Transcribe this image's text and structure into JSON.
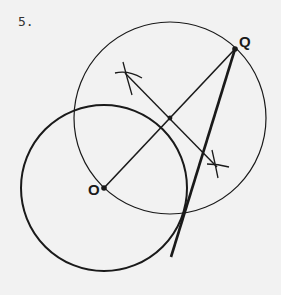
{
  "problem": {
    "number": "5."
  },
  "points": {
    "O": {
      "label": "O",
      "x": 104,
      "y": 188
    },
    "Q": {
      "label": "Q",
      "x": 235,
      "y": 49
    },
    "M": {
      "x": 170,
      "y": 118
    }
  },
  "circles": [
    {
      "name": "circle-centered-O",
      "cx": 104,
      "cy": 188,
      "r": 83,
      "stroke_width": 2
    },
    {
      "name": "circle-on-OQ-diameter",
      "cx": 170,
      "cy": 118,
      "r": 96,
      "stroke_width": 1.2
    }
  ],
  "colors": {
    "ink": "#1a1a1a",
    "background": "#f2f2f2"
  }
}
